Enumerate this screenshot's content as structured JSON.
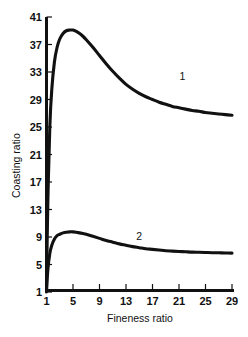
{
  "chart_data": {
    "type": "line",
    "title": "",
    "xlabel": "Fineness ratio",
    "ylabel": "Coasting ratio",
    "xlim": [
      1,
      29
    ],
    "ylim": [
      1,
      41
    ],
    "grid": false,
    "legend_position": "inline-curve-labels",
    "x_ticks": [
      "1",
      "5",
      "9",
      "13",
      "17",
      "21",
      "25",
      "29"
    ],
    "y_ticks": [
      "1",
      "5",
      "9",
      "13",
      "17",
      "21",
      "25",
      "29",
      "33",
      "37",
      "41"
    ],
    "series": [
      {
        "name": "1",
        "label": "1",
        "label_x": 21.5,
        "label_y": 31.8,
        "x": [
          1.0,
          1.2,
          1.5,
          1.8,
          2.2,
          2.6,
          3.0,
          3.5,
          4.0,
          4.5,
          5.0,
          5.5,
          6.0,
          6.5,
          7.0,
          8.0,
          9.0,
          10.0,
          11.0,
          12.0,
          13.0,
          14.0,
          15.0,
          16.0,
          17.0,
          18.0,
          19.0,
          20.0,
          21.0,
          22.0,
          23.0,
          24.0,
          25.0,
          26.0,
          27.0,
          28.0,
          29.0
        ],
        "y": [
          1.8,
          14.0,
          25.0,
          30.5,
          34.5,
          36.6,
          37.8,
          38.6,
          39.0,
          39.1,
          39.1,
          38.9,
          38.6,
          38.2,
          37.7,
          36.6,
          35.4,
          34.2,
          33.1,
          32.1,
          31.2,
          30.5,
          29.9,
          29.4,
          29.0,
          28.6,
          28.3,
          28.0,
          27.8,
          27.6,
          27.4,
          27.3,
          27.1,
          27.0,
          26.9,
          26.8,
          26.7
        ]
      },
      {
        "name": "2",
        "label": "2",
        "label_x": 15.0,
        "label_y": 8.5,
        "x": [
          1.0,
          1.2,
          1.5,
          1.8,
          2.2,
          2.6,
          3.0,
          3.5,
          4.0,
          4.5,
          5.0,
          5.5,
          6.0,
          6.5,
          7.0,
          8.0,
          9.0,
          10.0,
          11.0,
          12.0,
          13.0,
          14.0,
          15.0,
          16.0,
          17.0,
          18.0,
          19.0,
          20.0,
          21.0,
          22.0,
          23.0,
          24.0,
          25.0,
          26.0,
          27.0,
          28.0,
          29.0
        ],
        "y": [
          1.0,
          4.2,
          6.6,
          7.8,
          8.7,
          9.2,
          9.4,
          9.6,
          9.7,
          9.75,
          9.75,
          9.7,
          9.6,
          9.5,
          9.4,
          9.1,
          8.8,
          8.5,
          8.25,
          8.0,
          7.8,
          7.6,
          7.45,
          7.3,
          7.2,
          7.1,
          7.0,
          6.95,
          6.9,
          6.85,
          6.8,
          6.78,
          6.75,
          6.72,
          6.7,
          6.68,
          6.65
        ]
      }
    ]
  },
  "axis": {
    "x_title": "Fineness ratio",
    "y_title": "Coasting ratio"
  },
  "colors": {
    "background": "#ffffff",
    "ink": "#111111",
    "curve": "#111111"
  }
}
